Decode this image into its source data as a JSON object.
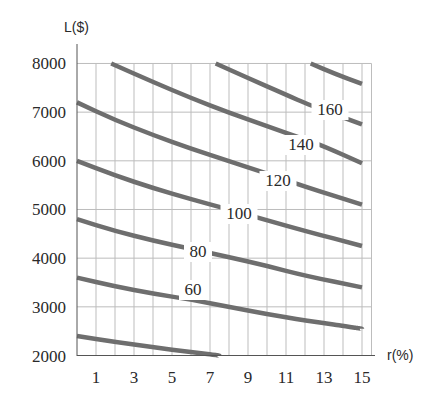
{
  "chart_data": {
    "type": "line",
    "title": "",
    "xlabel": "r(%)",
    "ylabel": "L($)",
    "xlim": [
      0,
      15.5
    ],
    "ylim": [
      2000,
      8000
    ],
    "grid": true,
    "x_ticks": [
      1,
      3,
      5,
      7,
      9,
      11,
      13,
      15
    ],
    "y_ticks": [
      2000,
      3000,
      4000,
      5000,
      6000,
      7000,
      8000
    ],
    "legend": "inline curve labels",
    "series": [
      {
        "name": "40",
        "label_visible": false,
        "points": [
          [
            0,
            2400
          ],
          [
            2,
            2280
          ],
          [
            4,
            2170
          ],
          [
            6,
            2070
          ],
          [
            7.5,
            2000
          ]
        ]
      },
      {
        "name": "60",
        "label_visible": true,
        "label_at_r": 7.0,
        "points": [
          [
            0,
            3600
          ],
          [
            2,
            3420
          ],
          [
            4,
            3270
          ],
          [
            6,
            3150
          ],
          [
            8,
            3000
          ],
          [
            10,
            2850
          ],
          [
            12,
            2720
          ],
          [
            15,
            2550
          ]
        ]
      },
      {
        "name": "80",
        "label_at_r": 9.5,
        "label_visible": true,
        "points": [
          [
            0,
            4800
          ],
          [
            2,
            4560
          ],
          [
            4,
            4360
          ],
          [
            6,
            4190
          ],
          [
            8,
            4020
          ],
          [
            10,
            3840
          ],
          [
            12,
            3640
          ],
          [
            15,
            3400
          ]
        ]
      },
      {
        "name": "100",
        "label_at_r": 11.0,
        "label_visible": true,
        "points": [
          [
            0,
            6000
          ],
          [
            2,
            5700
          ],
          [
            4,
            5440
          ],
          [
            6,
            5210
          ],
          [
            8,
            5000
          ],
          [
            10,
            4780
          ],
          [
            12,
            4560
          ],
          [
            15,
            4250
          ]
        ]
      },
      {
        "name": "120",
        "label_at_r": 13.0,
        "label_visible": true,
        "points": [
          [
            0,
            7200
          ],
          [
            2,
            6840
          ],
          [
            4,
            6530
          ],
          [
            6,
            6250
          ],
          [
            8,
            5990
          ],
          [
            10,
            5740
          ],
          [
            12,
            5470
          ],
          [
            15,
            5100
          ]
        ]
      },
      {
        "name": "140",
        "label_at_r": 14.2,
        "label_visible": true,
        "points": [
          [
            1.8,
            8000
          ],
          [
            4,
            7620
          ],
          [
            6,
            7290
          ],
          [
            8,
            6990
          ],
          [
            10,
            6710
          ],
          [
            12,
            6440
          ],
          [
            13,
            6300
          ],
          [
            15,
            5950
          ]
        ]
      },
      {
        "name": "160",
        "label_at_r": 15.0,
        "label_visible": true,
        "points": [
          [
            7.3,
            8000
          ],
          [
            9,
            7700
          ],
          [
            11,
            7360
          ],
          [
            12.2,
            7150
          ],
          [
            15,
            6750
          ]
        ]
      },
      {
        "name": "180",
        "label_visible": false,
        "points": [
          [
            12.3,
            8000
          ],
          [
            13.5,
            7800
          ],
          [
            15,
            7580
          ]
        ]
      }
    ]
  },
  "axes": {
    "y_label": "L($)",
    "x_label": "r(%)",
    "y_ticks": [
      "2000",
      "3000",
      "4000",
      "5000",
      "6000",
      "7000",
      "8000"
    ],
    "x_ticks": [
      "1",
      "3",
      "5",
      "7",
      "9",
      "11",
      "13",
      "15"
    ]
  },
  "labels": [
    {
      "text": "60",
      "x": 193,
      "y": 295
    },
    {
      "text": "80",
      "x": 198,
      "y": 257
    },
    {
      "text": "100",
      "x": 239,
      "y": 219
    },
    {
      "text": "120",
      "x": 278,
      "y": 186
    },
    {
      "text": "140",
      "x": 301,
      "y": 150
    },
    {
      "text": "160",
      "x": 330,
      "y": 115
    }
  ],
  "colors": {
    "curve": "#6e6e6e",
    "grid": "#bdbdbd",
    "axis": "#555555",
    "text": "#2a2a2a"
  }
}
